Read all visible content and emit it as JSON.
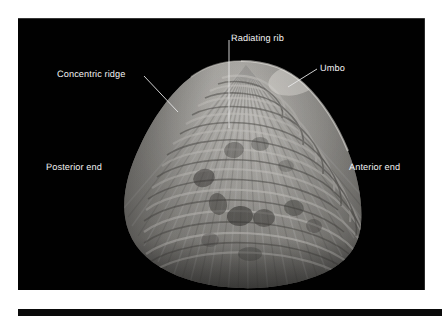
{
  "figure": {
    "background_color": "#010101",
    "page_color": "#ffffff",
    "label_color": "#f2f2f2",
    "leader_color": "#e8e8e8",
    "shell_color_light": "#d8d6d1",
    "shell_color_mid": "#a9a7a2",
    "shell_color_dark": "#5d5b58"
  },
  "labels": {
    "radiating_rib": "Radiating rib",
    "concentric_ridge": "Concentric ridge",
    "umbo": "Umbo",
    "posterior_end": "Posterior end",
    "anterior_end": "Anterior end"
  }
}
